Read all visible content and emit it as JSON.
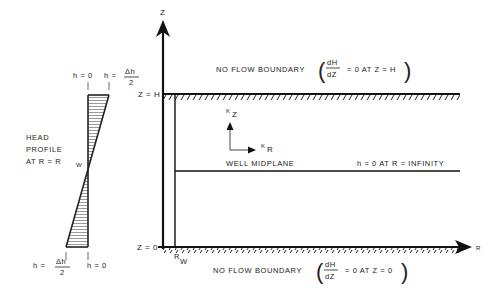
{
  "diagram": {
    "axes": {
      "z_axis_label": "Z",
      "r_axis_label": "R"
    },
    "boundaries": {
      "top_label_prefix": "NO FLOW BOUNDARY",
      "top_deriv_num": "dH",
      "top_deriv_den": "dZ",
      "top_condition": "= 0  AT  Z = H",
      "bottom_label_prefix": "NO FLOW BOUNDARY",
      "bottom_deriv_num": "dH",
      "bottom_deriv_den": "dZ",
      "bottom_condition": "= 0  AT  Z = 0"
    },
    "levels": {
      "top": "Z = H",
      "bottom": "Z = 0"
    },
    "well": {
      "radius_label": "R",
      "radius_subscript": "W",
      "midplane_label": "WELL  MIDPLANE",
      "far_field_condition": "h = 0  AT  R = INFINITY"
    },
    "conductivity": {
      "kz": "K",
      "kz_sub": "Z",
      "kr": "K",
      "kr_sub": "R"
    },
    "head_profile": {
      "title_line1": "HEAD",
      "title_line2": "PROFILE",
      "title_line3": "AT  R  =  R",
      "title_sub": "W",
      "top_left": "h = 0",
      "top_right_prefix": "h =",
      "top_right_num": "Δh",
      "top_right_den": "2",
      "bottom_left_prefix": "h =",
      "bottom_left_num": "Δh",
      "bottom_left_den": "2",
      "bottom_right": "h = 0"
    }
  }
}
